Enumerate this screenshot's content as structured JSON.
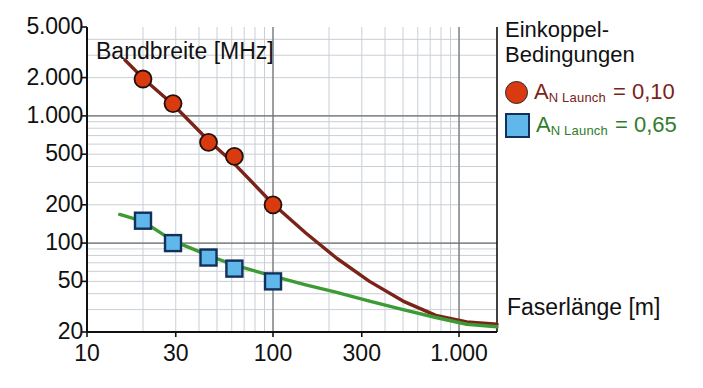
{
  "chart_data": {
    "type": "line",
    "title": "",
    "xlabel": "Faserlänge [m]",
    "ylabel": "Bandbreite [MHz]",
    "xscale": "log",
    "yscale": "log",
    "xlim": [
      10,
      1600
    ],
    "ylim": [
      20,
      5000
    ],
    "xticks": [
      "10",
      "30",
      "100",
      "300",
      "1.000"
    ],
    "xtick_values": [
      10,
      30,
      100,
      300,
      1000
    ],
    "yticks": [
      "20",
      "50",
      "100",
      "200",
      "500",
      "1.000",
      "2.000",
      "5.000"
    ],
    "ytick_values": [
      20,
      50,
      100,
      200,
      500,
      1000,
      2000,
      5000
    ],
    "grid": true,
    "legend_position": "right",
    "series": [
      {
        "name": "A_N Launch = 0,10",
        "marker": "circle",
        "color": "#D93A10",
        "line_color": "#7A2318",
        "points": [
          {
            "x": 20,
            "y": 1950
          },
          {
            "x": 29,
            "y": 1250
          },
          {
            "x": 45,
            "y": 620
          },
          {
            "x": 62,
            "y": 480
          },
          {
            "x": 100,
            "y": 200
          }
        ],
        "curve": [
          {
            "x": 16,
            "y": 2750
          },
          {
            "x": 20,
            "y": 1980
          },
          {
            "x": 29,
            "y": 1230
          },
          {
            "x": 45,
            "y": 640
          },
          {
            "x": 62,
            "y": 420
          },
          {
            "x": 100,
            "y": 203
          },
          {
            "x": 150,
            "y": 120
          },
          {
            "x": 220,
            "y": 76
          },
          {
            "x": 330,
            "y": 50
          },
          {
            "x": 500,
            "y": 35
          },
          {
            "x": 750,
            "y": 27
          },
          {
            "x": 1100,
            "y": 24
          },
          {
            "x": 1600,
            "y": 23
          }
        ]
      },
      {
        "name": "A_N Launch = 0,65",
        "marker": "square",
        "color": "#5FB7EA",
        "line_color": "#3D9B35",
        "points": [
          {
            "x": 20,
            "y": 150
          },
          {
            "x": 29,
            "y": 100
          },
          {
            "x": 45,
            "y": 77
          },
          {
            "x": 62,
            "y": 63
          },
          {
            "x": 100,
            "y": 50
          }
        ],
        "curve": [
          {
            "x": 15,
            "y": 168
          },
          {
            "x": 20,
            "y": 148
          },
          {
            "x": 29,
            "y": 104
          },
          {
            "x": 45,
            "y": 80
          },
          {
            "x": 62,
            "y": 67
          },
          {
            "x": 100,
            "y": 55
          },
          {
            "x": 150,
            "y": 47
          },
          {
            "x": 220,
            "y": 41
          },
          {
            "x": 330,
            "y": 35
          },
          {
            "x": 500,
            "y": 30
          },
          {
            "x": 750,
            "y": 26
          },
          {
            "x": 1100,
            "y": 23
          },
          {
            "x": 1600,
            "y": 22
          }
        ]
      }
    ]
  },
  "axis_titles": {
    "y_inplot": "Bandbreite [MHz]",
    "x_inplot": "Faserlänge [m]"
  },
  "legend": {
    "title_line1": "Einkoppel-",
    "title_line2": "Bedingungen",
    "entries": [
      {
        "symbol": "A",
        "sub": "N Launch",
        "equals": "= 0,10",
        "marker": "circle",
        "marker_color": "#D93A10",
        "text_color": "#7A2318"
      },
      {
        "symbol": "A",
        "sub": "N Launch",
        "equals": "= 0,65",
        "marker": "square",
        "marker_color": "#5FB7EA",
        "text_color": "#2F7D2B"
      }
    ]
  },
  "colors": {
    "red_marker": "#D93A10",
    "red_line": "#7A2318",
    "blue_marker": "#5FB7EA",
    "blue_border": "#12305c",
    "green_line": "#3D9B35",
    "grid_major": "#6d6d6d",
    "grid_minor": "#c9cfd6",
    "axis": "#111111",
    "background": "#ffffff"
  }
}
